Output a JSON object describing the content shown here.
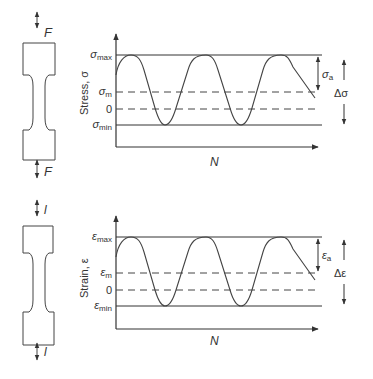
{
  "panels": [
    {
      "id": "stress",
      "load_label": "F",
      "y_axis_label": "Stress, σ",
      "x_axis_label": "N",
      "levels": {
        "max": {
          "sym": "σ",
          "sub": "max"
        },
        "mean": {
          "sym": "σ",
          "sub": "m"
        },
        "zero": {
          "sym": "0",
          "sub": ""
        },
        "min": {
          "sym": "σ",
          "sub": "min"
        }
      },
      "amplitude": {
        "sym": "σ",
        "sub": "a"
      },
      "range": "Δσ"
    },
    {
      "id": "strain",
      "load_label": "l",
      "y_axis_label": "Strain, ε",
      "x_axis_label": "N",
      "levels": {
        "max": {
          "sym": "ε",
          "sub": "max"
        },
        "mean": {
          "sym": "ε",
          "sub": "m"
        },
        "zero": {
          "sym": "0",
          "sub": ""
        },
        "min": {
          "sym": "ε",
          "sub": "min"
        }
      },
      "amplitude": {
        "sym": "ε",
        "sub": "a"
      },
      "range": "Δε"
    }
  ],
  "colors": {
    "line": "#333333",
    "background": "#ffffff"
  }
}
